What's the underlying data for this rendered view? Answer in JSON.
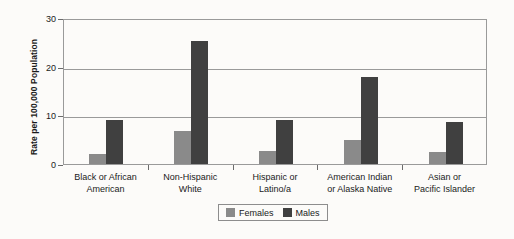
{
  "chart_data": {
    "type": "bar",
    "title": "",
    "xlabel": "",
    "ylabel": "Rate per 100,000 Population",
    "ylim": [
      0,
      30
    ],
    "yticks": [
      0,
      10,
      20,
      30
    ],
    "grid": true,
    "legend_position": "bottom-center",
    "categories": [
      "Black or African American",
      "Non-Hispanic White",
      "Hispanic or Latino/a",
      "American Indian or Alaska Native",
      "Asian or Pacific Islander"
    ],
    "category_lines": [
      [
        "Black or African",
        "American"
      ],
      [
        "Non-Hispanic",
        "White"
      ],
      [
        "Hispanic or",
        "Latino/a"
      ],
      [
        "American Indian",
        "or Alaska Native"
      ],
      [
        "Asian or",
        "Pacific Islander"
      ]
    ],
    "series": [
      {
        "name": "Females",
        "color": "#8a8a8a",
        "values": [
          2.0,
          6.8,
          2.6,
          5.0,
          2.4
        ]
      },
      {
        "name": "Males",
        "color": "#404040",
        "values": [
          9.0,
          25.3,
          9.0,
          17.8,
          8.7
        ]
      }
    ]
  },
  "legend": {
    "items": [
      {
        "label": "Females"
      },
      {
        "label": "Males"
      }
    ]
  },
  "axis": {
    "y_tick_labels": [
      "0",
      "10",
      "20",
      "30"
    ]
  }
}
